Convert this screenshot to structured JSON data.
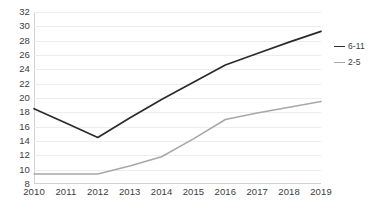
{
  "chart_data": {
    "type": "line",
    "title": "",
    "subtitle": "",
    "xlabel": "",
    "ylabel": "",
    "x": [
      2010,
      2011,
      2012,
      2013,
      2014,
      2015,
      2016,
      2017,
      2018,
      2019
    ],
    "categories": [
      "2010",
      "2011",
      "2012",
      "2013",
      "2014",
      "2015",
      "2016",
      "2017",
      "2018",
      "2019"
    ],
    "series": [
      {
        "name": "6-11",
        "color": "#2b2b2b",
        "values": [
          18.5,
          16.5,
          14.5,
          17.2,
          19.8,
          22.2,
          24.6,
          26.2,
          27.8,
          29.3
        ]
      },
      {
        "name": "2-5",
        "color": "#a8a8a8",
        "values": [
          9.4,
          9.4,
          9.4,
          10.5,
          11.8,
          14.3,
          17.0,
          17.9,
          18.7,
          19.5
        ]
      }
    ],
    "ylim": [
      8,
      32
    ],
    "ytick_step": 2,
    "yticks": [
      32,
      30,
      28,
      26,
      24,
      22,
      20,
      18,
      16,
      14,
      12,
      10,
      8
    ],
    "ytick_labels": [
      "32",
      "30",
      "28",
      "26",
      "24",
      "22",
      "20",
      "18",
      "16",
      "14",
      "12",
      "10",
      "8"
    ],
    "xlim": [
      2010,
      2019
    ],
    "xticks": [
      2010,
      2011,
      2012,
      2013,
      2014,
      2015,
      2016,
      2017,
      2018,
      2019
    ],
    "xtick_labels": [
      "2010",
      "2011",
      "2012",
      "2013",
      "2014",
      "2015",
      "2016",
      "2017",
      "2018",
      "2019"
    ],
    "grid": true,
    "grid_axis": "y",
    "grid_color": "#ededed",
    "axis_color": "#d0d0d0",
    "legend": {
      "position": "right",
      "entries": [
        {
          "label": "6-11",
          "color": "#2b2b2b"
        },
        {
          "label": "2-5",
          "color": "#a8a8a8"
        }
      ]
    },
    "background_color": "#ffffff",
    "text_color": "#3c3c3c",
    "annotations": []
  }
}
